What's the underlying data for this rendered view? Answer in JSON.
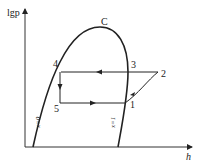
{
  "diagram": {
    "title": "",
    "axes": {
      "y_label": "lgp",
      "x_label": "h"
    },
    "critical_point": "C",
    "points": [
      {
        "id": "1",
        "label": "1"
      },
      {
        "id": "2",
        "label": "2"
      },
      {
        "id": "3",
        "label": "3"
      },
      {
        "id": "4",
        "label": "4"
      },
      {
        "id": "5",
        "label": "5"
      }
    ],
    "curves": {
      "saturated_liquid": "x=0",
      "saturated_vapor": "x=1"
    },
    "colors": {
      "line": "#222222",
      "background": "#ffffff"
    }
  }
}
